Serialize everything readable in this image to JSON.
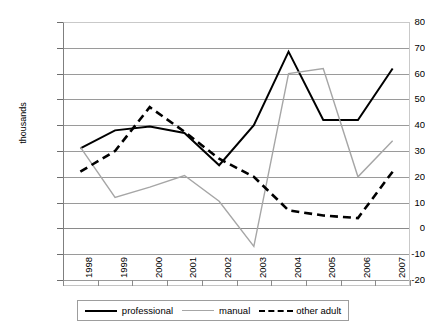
{
  "chart_data": {
    "type": "line",
    "title": "",
    "xlabel": "",
    "ylabel": "thousands",
    "categories": [
      "1998",
      "1999",
      "2000",
      "2001",
      "2002",
      "2003",
      "2004",
      "2005",
      "2006",
      "2007"
    ],
    "ylim": [
      -20,
      80
    ],
    "ytick_labels": [
      "80",
      "70",
      "60",
      "50",
      "40",
      "30",
      "20",
      "10",
      "0",
      "-10",
      "-20"
    ],
    "ytick_values": [
      80,
      70,
      60,
      50,
      40,
      30,
      20,
      10,
      0,
      -10,
      -20
    ],
    "grid": true,
    "legend_position": "bottom",
    "series": [
      {
        "name": "professional",
        "color": "#000000",
        "style": "solid",
        "values": [
          31,
          38,
          39.5,
          37,
          24.5,
          40,
          68.5,
          42,
          42,
          62
        ]
      },
      {
        "name": "manual",
        "color": "#a6a6a6",
        "style": "solid",
        "values": [
          31.5,
          12,
          16,
          20.5,
          10.5,
          -7,
          60,
          62,
          20,
          34
        ]
      },
      {
        "name": "other adult",
        "color": "#000000",
        "style": "dashed",
        "values": [
          22,
          30,
          47,
          37.5,
          27,
          20,
          7,
          5,
          4,
          22
        ]
      }
    ]
  },
  "axis": {
    "y_title": "thousands",
    "y_labels": [
      "80",
      "70",
      "60",
      "50",
      "40",
      "30",
      "20",
      "10",
      "0",
      "-10",
      "-20"
    ],
    "x_labels": [
      "1998",
      "1999",
      "2000",
      "2001",
      "2002",
      "2003",
      "2004",
      "2005",
      "2006",
      "2007"
    ]
  },
  "legend": {
    "items": [
      {
        "label": "professional"
      },
      {
        "label": "manual"
      },
      {
        "label": "other adult"
      }
    ]
  }
}
